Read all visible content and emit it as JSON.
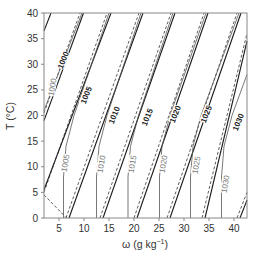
{
  "chart_data": {
    "type": "line",
    "title": "",
    "xlabel": "ω (g kg⁻¹)",
    "ylabel": "T (°C)",
    "xlim": [
      2,
      42.6
    ],
    "ylim": [
      0,
      40
    ],
    "grid": false,
    "legend": null,
    "x_ticks": [
      5,
      10,
      15,
      20,
      25,
      30,
      35,
      40
    ],
    "y_ticks": [
      0,
      5,
      10,
      15,
      20,
      25,
      30,
      35,
      40
    ],
    "x_tick_labels": [
      "5",
      "10",
      "15",
      "20",
      "25",
      "30",
      "35",
      "40"
    ],
    "y_tick_labels": [
      "0",
      "5",
      "10",
      "15",
      "20",
      "25",
      "30",
      "35",
      "40"
    ],
    "series": [
      {
        "name": "bold solid isolines",
        "style": "solid-black",
        "lines": [
          {
            "label": "1000",
            "points": [
              [
                2,
                19
              ],
              [
                9.9,
                40
              ]
            ]
          },
          {
            "label": "1005",
            "points": [
              [
                2,
                5.5
              ],
              [
                15.4,
                40
              ]
            ]
          },
          {
            "label": "1010",
            "points": [
              [
                7.0,
                0
              ],
              [
                21.8,
                40
              ]
            ]
          },
          {
            "label": "1015",
            "points": [
              [
                13.8,
                0
              ],
              [
                28.2,
                40
              ]
            ]
          },
          {
            "label": "1020",
            "points": [
              [
                20.6,
                0
              ],
              [
                34.8,
                40
              ]
            ]
          },
          {
            "label": "1025",
            "points": [
              [
                27.2,
                0
              ],
              [
                41.4,
                40
              ]
            ]
          },
          {
            "label": "1030",
            "points": [
              [
                34.2,
                0
              ],
              [
                42.6,
                34.5
              ]
            ]
          },
          {
            "label": "",
            "points": [
              [
                2,
                36.5
              ],
              [
                3.4,
                40
              ]
            ]
          },
          {
            "label": "",
            "points": [
              [
                41.2,
                0
              ],
              [
                42.6,
                3.5
              ]
            ]
          }
        ]
      },
      {
        "name": "dashed isolines",
        "style": "dashed-black",
        "lines": [
          {
            "points": [
              [
                2,
                20.5
              ],
              [
                9.2,
                40
              ]
            ]
          },
          {
            "points": [
              [
                2,
                4.5
              ],
              [
                6.5,
                0
              ]
            ]
          },
          {
            "points": [
              [
                2,
                5
              ],
              [
                14.6,
                40
              ]
            ]
          },
          {
            "points": [
              [
                6.4,
                0
              ],
              [
                21.0,
                40
              ]
            ]
          },
          {
            "points": [
              [
                13.2,
                0
              ],
              [
                27.4,
                40
              ]
            ]
          },
          {
            "points": [
              [
                20.0,
                0
              ],
              [
                34.0,
                40
              ]
            ]
          },
          {
            "points": [
              [
                26.6,
                0
              ],
              [
                40.6,
                40
              ]
            ]
          },
          {
            "points": [
              [
                33.6,
                0
              ],
              [
                42.6,
                36
              ]
            ]
          },
          {
            "points": [
              [
                40.6,
                0
              ],
              [
                42.6,
                5
              ]
            ]
          }
        ]
      },
      {
        "name": "grey isolines",
        "style": "solid-grey",
        "lines": [
          {
            "label": "1000",
            "points": [
              [
                2,
                21
              ],
              [
                4,
                26
              ],
              [
                9.6,
                40
              ]
            ]
          },
          {
            "label": "1005",
            "points": [
              [
                5.9,
                0
              ],
              [
                5.9,
                8
              ],
              [
                6.4,
                14
              ],
              [
                8,
                20
              ],
              [
                15.0,
                40
              ]
            ]
          },
          {
            "label": "1010",
            "points": [
              [
                12.5,
                0
              ],
              [
                12.5,
                8
              ],
              [
                13.0,
                14
              ],
              [
                14.6,
                20
              ],
              [
                21.4,
                40
              ]
            ]
          },
          {
            "label": "1015",
            "points": [
              [
                18.8,
                0
              ],
              [
                18.8,
                8
              ],
              [
                19.3,
                14
              ],
              [
                20.9,
                20
              ],
              [
                27.8,
                40
              ]
            ]
          },
          {
            "label": "1020",
            "points": [
              [
                25.1,
                0
              ],
              [
                25.1,
                8
              ],
              [
                25.6,
                14
              ],
              [
                27.2,
                20
              ],
              [
                34.4,
                40
              ]
            ]
          },
          {
            "label": "1025",
            "points": [
              [
                31.3,
                0
              ],
              [
                31.3,
                8
              ],
              [
                31.8,
                14
              ],
              [
                33.4,
                20
              ],
              [
                41.0,
                40
              ]
            ]
          },
          {
            "label": "1030",
            "points": [
              [
                37.5,
                0
              ],
              [
                37.5,
                8
              ],
              [
                38.0,
                14
              ],
              [
                39.6,
                20
              ],
              [
                42.6,
                28
              ]
            ]
          }
        ]
      }
    ]
  },
  "axes": {
    "x_title": "ω (g kg",
    "x_title_sup": "−1",
    "x_title_end": ")",
    "y_title": "T (°C)"
  },
  "labels": {
    "bold": [
      {
        "text": "1000",
        "x": 63,
        "y": 60
      },
      {
        "text": "1005",
        "x": 86,
        "y": 95
      },
      {
        "text": "1010",
        "x": 114,
        "y": 115
      },
      {
        "text": "1015",
        "x": 147,
        "y": 117
      },
      {
        "text": "1020",
        "x": 175,
        "y": 114
      },
      {
        "text": "1025",
        "x": 206,
        "y": 114
      },
      {
        "text": "1030",
        "x": 238,
        "y": 122
      }
    ],
    "grey": [
      {
        "text": "1000",
        "x": 52,
        "y": 87
      },
      {
        "text": "1005",
        "x": 65,
        "y": 163
      },
      {
        "text": "1010",
        "x": 101,
        "y": 164
      },
      {
        "text": "1015",
        "x": 132,
        "y": 164
      },
      {
        "text": "1020",
        "x": 163,
        "y": 164
      },
      {
        "text": "1025",
        "x": 196,
        "y": 165
      },
      {
        "text": "1030",
        "x": 225,
        "y": 184
      }
    ]
  }
}
